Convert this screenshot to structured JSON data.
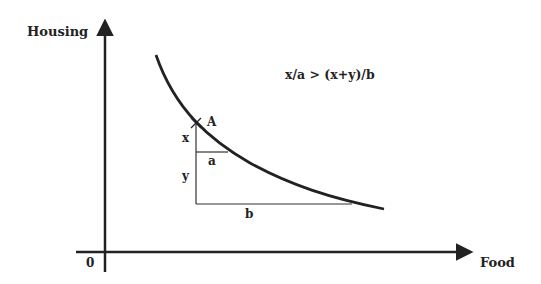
{
  "diagram": {
    "axes": {
      "y_label": "Housing",
      "x_label": "Food",
      "origin_label": "0"
    },
    "point_label": "A",
    "segment_labels": {
      "x": "x",
      "y": "y",
      "a": "a",
      "b": "b"
    },
    "inequality": "x/a > (x+y)/b",
    "colors": {
      "ink": "#222222",
      "background": "#ffffff"
    }
  }
}
